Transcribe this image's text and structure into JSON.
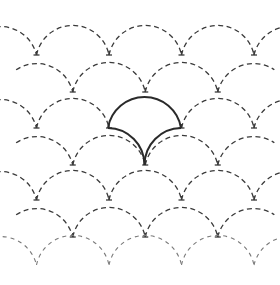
{
  "diagram": {
    "title": "",
    "pattern": "fish-scale (seigaiha) quilting grid",
    "rows": 7,
    "columns_even_rows": 4,
    "columns_odd_rows": 3,
    "highlighted_scale": {
      "row": 1,
      "column": 1
    },
    "colors": {
      "background": "#ffffff",
      "dashed_line": "#3a3a3a",
      "solid_line": "#2a2a2a"
    },
    "line_styles": {
      "grid": "dashed",
      "highlight": "solid"
    }
  }
}
